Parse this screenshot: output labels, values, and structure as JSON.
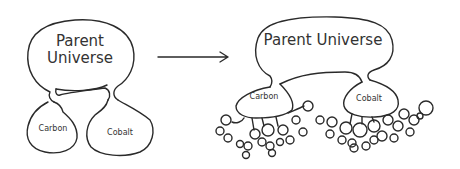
{
  "diagram": {
    "left": {
      "parent_label_line1": "Parent",
      "parent_label_line2": "Universe",
      "child1": "Carbon",
      "child2": "Cobalt"
    },
    "right": {
      "parent_label": "Parent Universe",
      "child1": "Carbon",
      "child2": "Cobalt"
    },
    "arrow": "right-arrow"
  }
}
